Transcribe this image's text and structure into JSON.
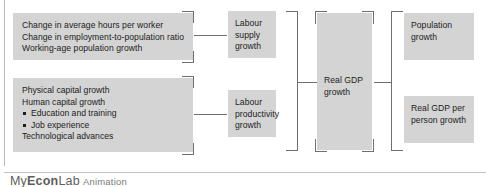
{
  "figure": {
    "boxes": {
      "labour_supply_sources": {
        "lines": "Change in average hours per worker\nChange in employment-to-population ratio\nWorking-age population growth"
      },
      "productivity_sources": {
        "line1": "Physical capital growth",
        "line2": "Human capital growth",
        "bullet1": "Education and training",
        "bullet2": "Job experience",
        "line3": "Technological advances"
      },
      "labour_supply_growth": {
        "text": "Labour\nsupply\ngrowth"
      },
      "labour_productivity_growth": {
        "text": "Labour\nproductivity\ngrowth"
      },
      "real_gdp_growth": {
        "text": "Real GDP\ngrowth"
      },
      "population_growth": {
        "text": "Population\ngrowth"
      },
      "real_gdp_per_person_growth": {
        "text": "Real GDP per\nperson growth"
      }
    },
    "colors": {
      "box_fill": "#d4d4d4",
      "bracket": "#6f6f6f",
      "text": "#1c1c1c",
      "footer_text": "#6a6a6a",
      "rule": "#c2c2c2"
    }
  },
  "footer": {
    "brand_prefix": "My",
    "brand_mid": "Econ",
    "brand_suffix": "Lab",
    "label": "Animation"
  }
}
